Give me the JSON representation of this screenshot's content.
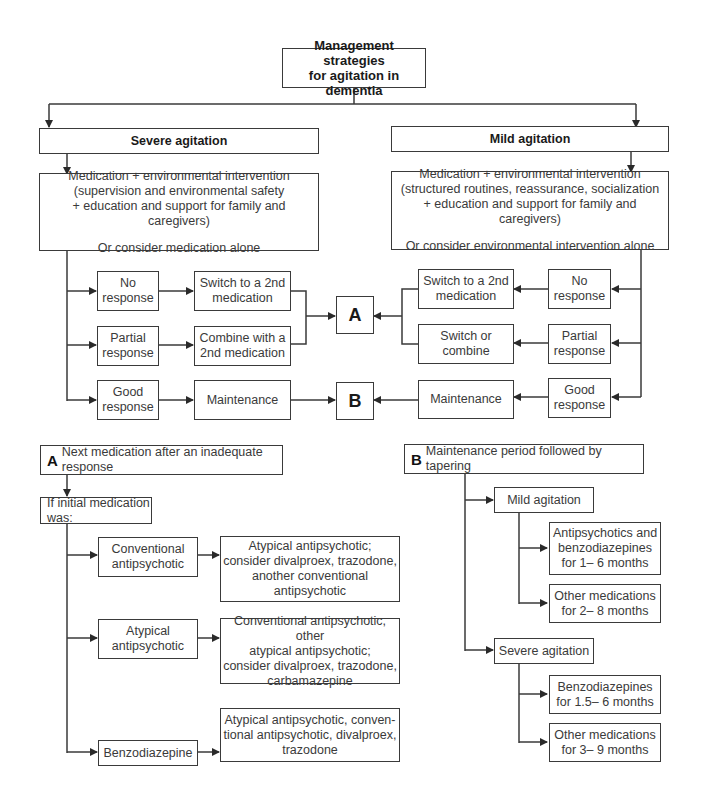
{
  "title": {
    "line1": "Management strategies",
    "line2": "for agitation in dementia"
  },
  "severe": {
    "label": "Severe agitation",
    "intervention": {
      "line1": "Medication + environmental intervention",
      "line2": "(supervision and environmental safety",
      "line3": "+ education and support for family and caregivers)",
      "alt": "Or consider medication alone"
    },
    "responses": [
      {
        "response": [
          "No",
          "response"
        ],
        "action": [
          "Switch to a 2nd",
          "medication"
        ],
        "target": "A"
      },
      {
        "response": [
          "Partial",
          "response"
        ],
        "action": [
          "Combine with a",
          "2nd medication"
        ],
        "target": "A"
      },
      {
        "response": [
          "Good",
          "response"
        ],
        "action": [
          "Maintenance"
        ],
        "target": "B"
      }
    ]
  },
  "mild": {
    "label": "Mild agitation",
    "intervention": {
      "line1": "Medication + environmental intervention",
      "line2": "(structured routines, reassurance, socialization",
      "line3": "+ education and support for family and caregivers)",
      "alt": "Or consider environmental intervention alone"
    },
    "responses": [
      {
        "response": [
          "No",
          "response"
        ],
        "action": [
          "Switch to a 2nd",
          "medication"
        ],
        "target": "A"
      },
      {
        "response": [
          "Partial",
          "response"
        ],
        "action": [
          "Switch or",
          "combine"
        ],
        "target": "A"
      },
      {
        "response": [
          "Good",
          "response"
        ],
        "action": [
          "Maintenance"
        ],
        "target": "B"
      }
    ]
  },
  "nodes": {
    "a": "A",
    "b": "B"
  },
  "panel_a": {
    "letter": "A",
    "title": "Next medication after an inadequate response",
    "condition": "If initial medication was:",
    "rows": [
      {
        "initial": [
          "Conventional",
          "antipsychotic"
        ],
        "next": [
          "Atypical antipsychotic;",
          "consider divalproex, trazodone,",
          "another conventional",
          "antipsychotic"
        ]
      },
      {
        "initial": [
          "Atypical",
          "antipsychotic"
        ],
        "next": [
          "Conventional antipsychotic, other",
          "atypical antipsychotic;",
          "consider divalproex, trazodone,",
          "carbamazepine"
        ]
      },
      {
        "initial": [
          "Benzodiazepine"
        ],
        "next": [
          "Atypical antipsychotic, conven-",
          "tional antipsychotic, divalproex,",
          "trazodone"
        ]
      }
    ]
  },
  "panel_b": {
    "letter": "B",
    "title": "Maintenance period followed by tapering",
    "groups": [
      {
        "label": "Mild agitation",
        "items": [
          [
            "Antipsychotics and",
            "benzodiazepines",
            "for 1– 6 months"
          ],
          [
            "Other medications",
            "for 2– 8 months"
          ]
        ]
      },
      {
        "label": "Severe agitation",
        "items": [
          [
            "Benzodiazepines",
            "for 1.5– 6 months"
          ],
          [
            "Other medications",
            "for 3– 9 months"
          ]
        ]
      }
    ]
  }
}
